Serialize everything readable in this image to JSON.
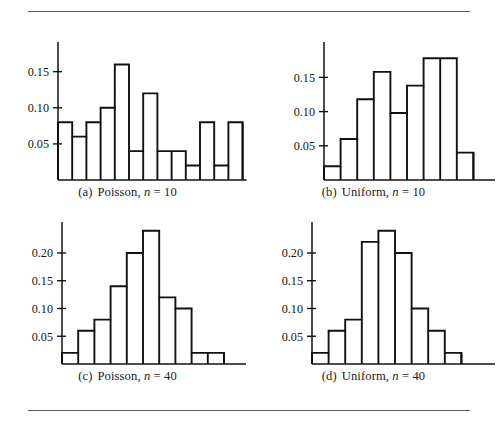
{
  "figure": {
    "top_rule": true,
    "bottom_rule": true,
    "rule_color": "#5d5d5d",
    "background": "#ffffff",
    "bar_stroke": "#111111",
    "axis_color": "#111111"
  },
  "chart_data": [
    {
      "type": "bar",
      "id": "a",
      "title": "",
      "caption_label": "(a)",
      "caption_text": "Poisson,",
      "caption_var": "n",
      "caption_eq": "= 10",
      "xlabel": "",
      "ylabel": "",
      "ylim": [
        0,
        0.18
      ],
      "yticks": [
        0.05,
        0.1,
        0.15
      ],
      "ytick_labels": [
        "0.05",
        "0.10",
        "0.15"
      ],
      "grid": false,
      "legend": "none",
      "categories": [
        "1",
        "2",
        "3",
        "4",
        "5",
        "6",
        "7",
        "8",
        "9",
        "10",
        "11",
        "12",
        "13"
      ],
      "values": [
        0.08,
        0.06,
        0.08,
        0.1,
        0.16,
        0.04,
        0.12,
        0.04,
        0.04,
        0.02,
        0.08,
        0.02,
        0.08
      ]
    },
    {
      "type": "bar",
      "id": "b",
      "title": "",
      "caption_label": "(b)",
      "caption_text": "Uniform,",
      "caption_var": "n",
      "caption_eq": "= 10",
      "xlabel": "",
      "ylabel": "",
      "ylim": [
        0,
        0.19
      ],
      "yticks": [
        0.05,
        0.1,
        0.15
      ],
      "ytick_labels": [
        "0.05",
        "0.10",
        "0.15"
      ],
      "grid": false,
      "legend": "none",
      "categories": [
        "1",
        "2",
        "3",
        "4",
        "5",
        "6",
        "7",
        "8",
        "9"
      ],
      "values": [
        0.02,
        0.06,
        0.118,
        0.158,
        0.098,
        0.138,
        0.178,
        0.178,
        0.04
      ]
    },
    {
      "type": "bar",
      "id": "c",
      "title": "",
      "caption_label": "(c)",
      "caption_text": "Poisson,",
      "caption_var": "n",
      "caption_eq": "= 40",
      "xlabel": "",
      "ylabel": "",
      "ylim": [
        0,
        0.245
      ],
      "yticks": [
        0.05,
        0.1,
        0.15,
        0.2
      ],
      "ytick_labels": [
        "0.05",
        "0.10",
        "0.15",
        "0.20"
      ],
      "grid": false,
      "legend": "none",
      "categories": [
        "1",
        "2",
        "3",
        "4",
        "5",
        "6",
        "7",
        "8",
        "9",
        "10"
      ],
      "values": [
        0.02,
        0.06,
        0.08,
        0.14,
        0.2,
        0.24,
        0.12,
        0.1,
        0.02,
        0.02
      ]
    },
    {
      "type": "bar",
      "id": "d",
      "title": "",
      "caption_label": "(d)",
      "caption_text": "Uniform,",
      "caption_var": "n",
      "caption_eq": "= 40",
      "xlabel": "",
      "ylabel": "",
      "ylim": [
        0,
        0.245
      ],
      "yticks": [
        0.05,
        0.1,
        0.15,
        0.2
      ],
      "ytick_labels": [
        "0.05",
        "0.10",
        "0.15",
        "0.20"
      ],
      "grid": false,
      "legend": "none",
      "categories": [
        "1",
        "2",
        "3",
        "4",
        "5",
        "6",
        "7",
        "8",
        "9"
      ],
      "values": [
        0.02,
        0.06,
        0.08,
        0.22,
        0.24,
        0.2,
        0.1,
        0.06,
        0.02
      ]
    }
  ]
}
